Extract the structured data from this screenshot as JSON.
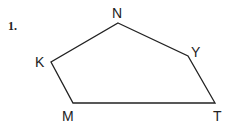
{
  "problem_number": "1.",
  "figure": {
    "type": "pentagon",
    "stroke_color": "#222222",
    "vertices": [
      {
        "name": "N",
        "x": 118,
        "y": 23,
        "label_x": 112,
        "label_y": 18
      },
      {
        "name": "Y",
        "x": 188,
        "y": 56,
        "label_x": 191,
        "label_y": 57
      },
      {
        "name": "T",
        "x": 215,
        "y": 103,
        "label_x": 213,
        "label_y": 121
      },
      {
        "name": "M",
        "x": 73,
        "y": 103,
        "label_x": 62,
        "label_y": 121
      },
      {
        "name": "K",
        "x": 51,
        "y": 62,
        "label_x": 35,
        "label_y": 67
      }
    ]
  }
}
